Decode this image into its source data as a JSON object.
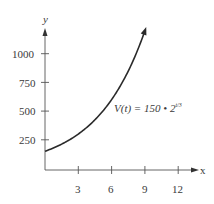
{
  "chart_data": {
    "type": "line",
    "title": "",
    "function_label": "V(t) = 150 • 2^(t/3)",
    "xlabel": "x",
    "ylabel": "y",
    "x_ticks": [
      3,
      6,
      9,
      12
    ],
    "y_ticks": [
      250,
      500,
      750,
      1000
    ],
    "xlim": [
      0,
      13.5
    ],
    "ylim": [
      0,
      1200
    ],
    "grid": false,
    "legend": null,
    "series": [
      {
        "name": "V(t) = 150 • 2^(t/3)",
        "x": [
          0,
          1,
          2,
          3,
          4,
          5,
          6,
          7,
          8,
          9,
          9.2
        ],
        "values": [
          150,
          189,
          238,
          300,
          378,
          476,
          600,
          756,
          952,
          1200,
          1254
        ]
      }
    ]
  },
  "labels": {
    "y_axis": "y",
    "x_axis": "x",
    "y_ticks": [
      "1000",
      "750",
      "500",
      "250"
    ],
    "x_ticks": [
      "3",
      "6",
      "9",
      "12"
    ],
    "formula_main": "V(t) = 150 • 2",
    "formula_exp": "t/3"
  }
}
